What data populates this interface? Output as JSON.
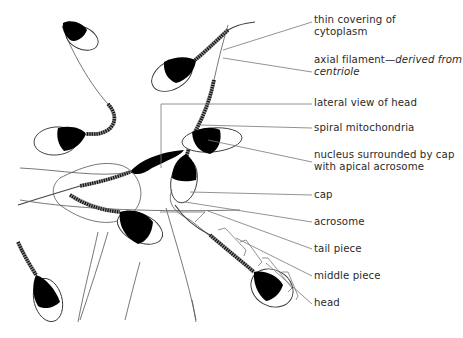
{
  "diagram": {
    "labels": [
      {
        "id": "thin-covering",
        "line1": "thin covering of",
        "line2": "cytoplasm",
        "top": 14
      },
      {
        "id": "axial-filament",
        "line1_plain": "axial filament—",
        "line1_italic": "derived from",
        "line2_italic": "centriole",
        "top": 54
      },
      {
        "id": "lateral-view",
        "line1": "lateral view of head",
        "top": 97
      },
      {
        "id": "spiral-mitochondria",
        "line1": "spiral mitochondria",
        "top": 122
      },
      {
        "id": "nucleus",
        "line1": "nucleus surrounded by cap",
        "line2": "with apical acrosome",
        "top": 149
      },
      {
        "id": "cap",
        "line1": "cap",
        "top": 189
      },
      {
        "id": "acrosome",
        "line1": "acrosome",
        "top": 216
      },
      {
        "id": "tail-piece",
        "line1": "tail piece",
        "top": 243
      },
      {
        "id": "middle-piece",
        "line1": "middle piece",
        "top": 270
      },
      {
        "id": "head",
        "line1": "head",
        "top": 297
      }
    ],
    "colors": {
      "nucleus": "#000000",
      "outline": "#333333",
      "leader_lines": "#777777",
      "text": "#2a2a2a",
      "background": "#ffffff"
    }
  }
}
